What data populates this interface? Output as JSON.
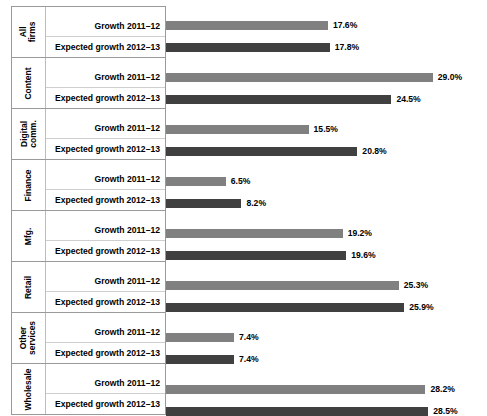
{
  "chart_data": {
    "type": "bar",
    "orientation": "horizontal",
    "title": "",
    "xlabel": "",
    "ylabel": "",
    "grid": false,
    "legend_position": "none",
    "axis_min": 0,
    "axis_max": 29.0,
    "value_suffix": "%",
    "categories": [
      "All firms",
      "Content",
      "Digital comm.",
      "Finance",
      "Mfg.",
      "Retail",
      "Other services",
      "Wholesale"
    ],
    "series": [
      {
        "name": "Growth 2011–12",
        "color": "#808080",
        "values": [
          17.6,
          29.0,
          15.5,
          6.5,
          19.2,
          25.3,
          7.4,
          28.2
        ]
      },
      {
        "name": "Expected growth 2012–13",
        "color": "#404040",
        "values": [
          17.8,
          24.5,
          20.8,
          8.2,
          19.6,
          25.9,
          7.4,
          28.5
        ]
      }
    ]
  },
  "groups": [
    {
      "category_lines": [
        "All",
        "firms"
      ],
      "rows": [
        {
          "series_label": "Growth 2011–12",
          "value": 17.6,
          "value_label": "17.6%",
          "color": "#808080"
        },
        {
          "series_label": "Expected growth 2012–13",
          "value": 17.8,
          "value_label": "17.8%",
          "color": "#404040"
        }
      ]
    },
    {
      "category_lines": [
        "Content"
      ],
      "rows": [
        {
          "series_label": "Growth 2011–12",
          "value": 29.0,
          "value_label": "29.0%",
          "color": "#808080"
        },
        {
          "series_label": "Expected growth 2012–13",
          "value": 24.5,
          "value_label": "24.5%",
          "color": "#404040"
        }
      ]
    },
    {
      "category_lines": [
        "Digital",
        "comm."
      ],
      "rows": [
        {
          "series_label": "Growth 2011–12",
          "value": 15.5,
          "value_label": "15.5%",
          "color": "#808080"
        },
        {
          "series_label": "Expected growth 2012–13",
          "value": 20.8,
          "value_label": "20.8%",
          "color": "#404040"
        }
      ]
    },
    {
      "category_lines": [
        "Finance"
      ],
      "rows": [
        {
          "series_label": "Growth 2011–12",
          "value": 6.5,
          "value_label": "6.5%",
          "color": "#808080"
        },
        {
          "series_label": "Expected growth 2012–13",
          "value": 8.2,
          "value_label": "8.2%",
          "color": "#404040"
        }
      ]
    },
    {
      "category_lines": [
        "Mfg."
      ],
      "rows": [
        {
          "series_label": "Growth 2011–12",
          "value": 19.2,
          "value_label": "19.2%",
          "color": "#808080"
        },
        {
          "series_label": "Expected growth 2012–13",
          "value": 19.6,
          "value_label": "19.6%",
          "color": "#404040"
        }
      ]
    },
    {
      "category_lines": [
        "Retail"
      ],
      "rows": [
        {
          "series_label": "Growth 2011–12",
          "value": 25.3,
          "value_label": "25.3%",
          "color": "#808080"
        },
        {
          "series_label": "Expected growth 2012–13",
          "value": 25.9,
          "value_label": "25.9%",
          "color": "#404040"
        }
      ]
    },
    {
      "category_lines": [
        "Other",
        "services"
      ],
      "rows": [
        {
          "series_label": "Growth 2011–12",
          "value": 7.4,
          "value_label": "7.4%",
          "color": "#808080"
        },
        {
          "series_label": "Expected growth 2012–13",
          "value": 7.4,
          "value_label": "7.4%",
          "color": "#404040"
        }
      ]
    },
    {
      "category_lines": [
        "Wholesale"
      ],
      "rows": [
        {
          "series_label": "Growth 2011–12",
          "value": 28.2,
          "value_label": "28.2%",
          "color": "#808080"
        },
        {
          "series_label": "Expected growth 2012–13",
          "value": 28.5,
          "value_label": "28.5%",
          "color": "#404040"
        }
      ]
    }
  ],
  "layout": {
    "px_per_unit": 9.2,
    "row_height": 21,
    "group_gap": 8,
    "table_top": 6,
    "bar_origin_x": 166
  }
}
